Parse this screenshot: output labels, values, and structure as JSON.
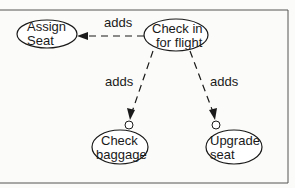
{
  "diagram": {
    "type": "use-case",
    "nodes": {
      "checkin": {
        "line1": "Check in",
        "line2": "for flight"
      },
      "assign": {
        "line1": "Assign",
        "line2": "Seat"
      },
      "baggage": {
        "line1": "Check",
        "line2": "baggage"
      },
      "upgrade": {
        "line1": "Upgrade",
        "line2": "seat"
      }
    },
    "edges": [
      {
        "from": "Check in for flight",
        "to": "Assign Seat",
        "label": "adds"
      },
      {
        "from": "Check in for flight",
        "to": "Check baggage",
        "label": "adds"
      },
      {
        "from": "Check in for flight",
        "to": "Upgrade seat",
        "label": "adds"
      }
    ],
    "colors": {
      "stroke": "#1a1a1a",
      "background": "#fbfbf9"
    }
  }
}
